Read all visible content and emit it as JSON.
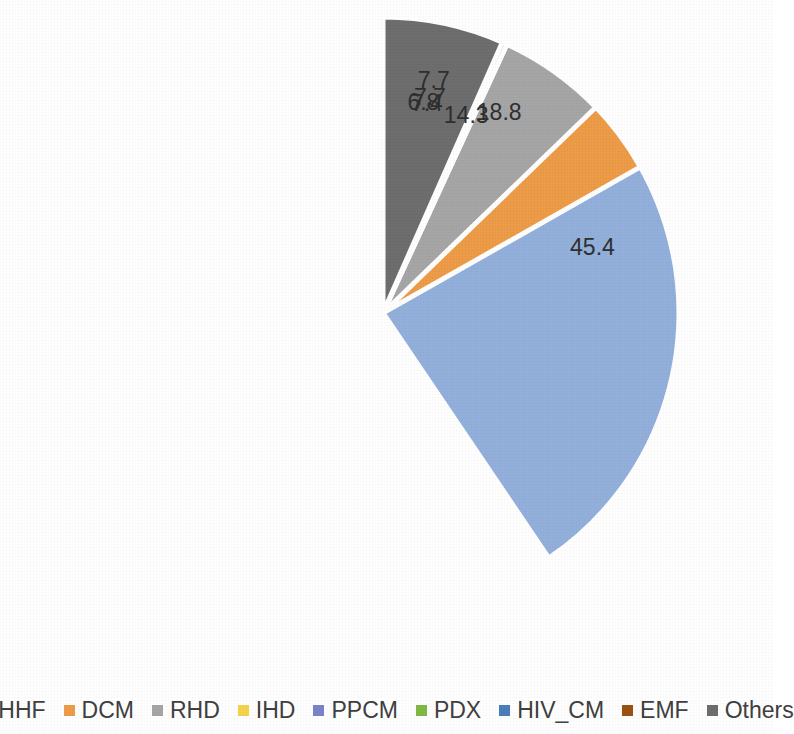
{
  "chart_data": {
    "type": "pie",
    "title": "",
    "subtitle": "",
    "xlabel": "",
    "ylabel": "",
    "categories": [
      "HHF",
      "DCM",
      "RHD",
      "IHD",
      "PPCM",
      "PDX",
      "HIV_CM",
      "EMF",
      "Others"
    ],
    "values": [
      45.4,
      18.8,
      14.3,
      7.7,
      7.7,
      6.8,
      2.6,
      1.3,
      7.4
    ],
    "labels": [
      "45.4",
      "18.8",
      "14.3",
      "7.7",
      "7.7",
      "6.8",
      "2.6",
      "1.3",
      "7.4"
    ],
    "colors": [
      "#93B0DC",
      "#ED9C48",
      "#A6A6A6",
      "#F5D34B",
      "#7B84C8",
      "#7FBA43",
      "#4A7EBB",
      "#9C5213",
      "#6E6E6E"
    ],
    "label_colors": [
      "#3a3a3a",
      "#4a3018",
      "#3a3a3a",
      "#3a3a3a",
      "#3a3a3a",
      "#3a3a3a",
      "#3a3a3a",
      "#3a3a3a",
      "#3a3a3a"
    ],
    "label_radius_fraction": [
      0.74,
      0.78,
      0.72,
      0.8,
      0.74,
      0.72,
      1.12,
      1.12,
      0.72
    ],
    "start_angle_deg": 0,
    "direction": "clockwise",
    "total": 112.0,
    "grid": false,
    "legend_position": "bottom",
    "center": {
      "cx": 383,
      "cy": 313
    },
    "radius": 296
  },
  "legend": {
    "items": [
      {
        "label": "HHF",
        "color": "#93B0DC",
        "marker": "square-marker"
      },
      {
        "label": "DCM",
        "color": "#ED9C48",
        "marker": "square-marker"
      },
      {
        "label": "RHD",
        "color": "#A6A6A6",
        "marker": "square-marker"
      },
      {
        "label": "IHD",
        "color": "#F5D34B",
        "marker": "square-marker"
      },
      {
        "label": "PPCM",
        "color": "#7B84C8",
        "marker": "square-marker"
      },
      {
        "label": "PDX",
        "color": "#7FBA43",
        "marker": "square-marker"
      },
      {
        "label": "HIV_CM",
        "color": "#4A7EBB",
        "marker": "square-marker"
      },
      {
        "label": "EMF",
        "color": "#9C5213",
        "marker": "square-marker"
      },
      {
        "label": "Others",
        "color": "#6E6E6E",
        "marker": "square-marker"
      }
    ]
  }
}
